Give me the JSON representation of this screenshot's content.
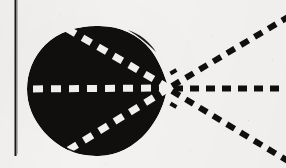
{
  "figure": {
    "background_color": "#f3f2f0",
    "ink_color": "#100f0d",
    "dash_light_color": "#f4f3f1",
    "canvas": {
      "width": 286,
      "height": 168
    }
  },
  "elements": {
    "margin_rule": {
      "name": "vertical margin rule",
      "x": 15,
      "y_start": 0,
      "y_end": 156,
      "thickness": 2,
      "color": "#1a1917"
    },
    "blob": {
      "name": "solid black oval region",
      "center_x": 96,
      "center_y": 91,
      "radius_x": 68,
      "radius_y": 65,
      "apex_x": 168,
      "apex_y": 88,
      "fill": "#100f0d"
    },
    "vertex": {
      "name": "convergence point of the three rays",
      "x": 169,
      "y": 88
    },
    "rays": [
      {
        "id": "upper-ray",
        "label": "upper dashed ray",
        "from_x": 169,
        "from_y": 88,
        "to_x": 286,
        "to_y": 18,
        "inside_endpoint_x": 70,
        "inside_endpoint_y": 31,
        "angle_deg": -31
      },
      {
        "id": "axis-ray",
        "label": "horizontal dashed axis ray",
        "from_x": 169,
        "from_y": 88,
        "to_x": 286,
        "to_y": 88,
        "inside_endpoint_x": 26,
        "inside_endpoint_y": 89,
        "angle_deg": 0
      },
      {
        "id": "lower-ray",
        "label": "lower dashed ray",
        "from_x": 169,
        "from_y": 88,
        "to_x": 286,
        "to_y": 160,
        "inside_endpoint_x": 68,
        "inside_endpoint_y": 150,
        "angle_deg": 31
      }
    ],
    "dash_pattern": {
      "dash_length": 9,
      "gap_length": 7,
      "stroke_width": 6
    }
  }
}
